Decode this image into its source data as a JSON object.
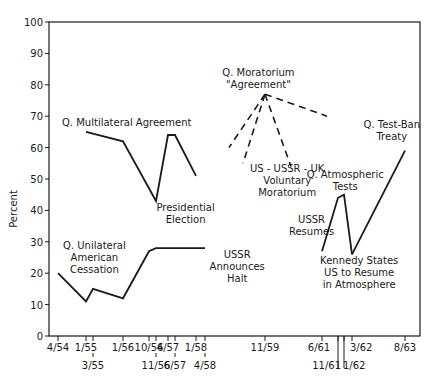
{
  "chart_data": {
    "type": "line",
    "title": "",
    "xlabel": "",
    "ylabel": "Percent",
    "ylim": [
      0,
      100
    ],
    "yticks": [
      0,
      10,
      20,
      30,
      40,
      50,
      60,
      70,
      80,
      90,
      100
    ],
    "grid": false,
    "legend": "none (series labeled by inline annotations)",
    "x_ticks": [
      {
        "label": "4/54",
        "x": 58,
        "row": 1
      },
      {
        "label": "1/55",
        "x": 86,
        "row": 1
      },
      {
        "label": "3/55",
        "x": 93,
        "row": 2
      },
      {
        "label": "1/56",
        "x": 123,
        "row": 1
      },
      {
        "label": "10/56",
        "x": 149,
        "row": 1
      },
      {
        "label": "11/56",
        "x": 156,
        "row": 2
      },
      {
        "label": "4/57",
        "x": 168,
        "row": 1
      },
      {
        "label": "6/57",
        "x": 175,
        "row": 2
      },
      {
        "label": "1/58",
        "x": 196,
        "row": 1
      },
      {
        "label": "4/58",
        "x": 205,
        "row": 2
      },
      {
        "label": "11/59",
        "x": 265,
        "row": 1
      },
      {
        "label": "6/61",
        "x": 322,
        "row": 1
      },
      {
        "label": "11/61",
        "x": 338,
        "row": 2
      },
      {
        "label": "1/62",
        "x": 344,
        "row": 2
      },
      {
        "label": "3/62",
        "x": 352,
        "row": 1
      },
      {
        "label": "8/63",
        "x": 405,
        "row": 1
      }
    ],
    "series": [
      {
        "name": "Q. Unilateral American Cessation",
        "style": "solid",
        "x": [
          "4/54",
          "1/55",
          "3/55",
          "1/56",
          "10/56",
          "11/56",
          "4/58"
        ],
        "values": [
          20,
          11,
          15,
          12,
          27,
          28,
          28
        ]
      },
      {
        "name": "Q. Multilateral Agreement",
        "style": "solid",
        "x": [
          "1/55",
          "1/56",
          "11/56",
          "4/57",
          "6/57",
          "1/58"
        ],
        "values": [
          65,
          62,
          43,
          64,
          64,
          51
        ]
      },
      {
        "name": "Q. Moratorium \"Agreement\"",
        "style": "dashed",
        "note": "Four dashed lines radiating from a common point at 11/59 (~77%)",
        "apex": {
          "x": "11/59",
          "value": 77
        },
        "branches": [
          {
            "end_value": 60,
            "direction": "left-far"
          },
          {
            "end_value": 55,
            "direction": "left-near"
          },
          {
            "end_value": 54,
            "direction": "right-near"
          },
          {
            "end_value": 70,
            "direction": "right-far"
          }
        ]
      },
      {
        "name": "Q. Atmospheric Tests",
        "style": "solid",
        "x": [
          "6/61",
          "11/61",
          "1/62",
          "3/62"
        ],
        "values": [
          27,
          44,
          45,
          26
        ]
      },
      {
        "name": "Q. Test-Ban Treaty",
        "style": "solid",
        "x": [
          "3/62",
          "8/63"
        ],
        "values": [
          26,
          59
        ]
      }
    ],
    "annotations": [
      {
        "text": [
          "Q. Multilateral Agreement"
        ],
        "x": 62,
        "y": 126
      },
      {
        "text": [
          "Presidential",
          "Election"
        ],
        "x": 152,
        "y": 211
      },
      {
        "text": [
          "Q. Unilateral",
          "American",
          "Cessation"
        ],
        "x": 58,
        "y": 249
      },
      {
        "text": [
          "USSR",
          "Announces",
          "Halt"
        ],
        "x": 212,
        "y": 258
      },
      {
        "text": [
          "Q. Moratorium",
          "\"Agreement\""
        ],
        "x": 222,
        "y": 76
      },
      {
        "text": [
          "US - USSR - UK",
          "Voluntary",
          "Moratorium"
        ],
        "x": 248,
        "y": 172
      },
      {
        "text": [
          "USSR",
          "Resumes"
        ],
        "x": 292,
        "y": 223
      },
      {
        "text": [
          "Q. Atmospheric",
          "Tests"
        ],
        "x": 306,
        "y": 178
      },
      {
        "text": [
          "Kennedy States",
          "US to Resume",
          "in Atmosphere"
        ],
        "x": 320,
        "y": 264
      },
      {
        "text": [
          "Q. Test-Ban",
          "Treaty"
        ],
        "x": 361,
        "y": 128
      }
    ]
  },
  "plot": {
    "left": 49,
    "right": 420,
    "top": 22,
    "bottom": 336,
    "ink_color": "#1a1a1a"
  }
}
